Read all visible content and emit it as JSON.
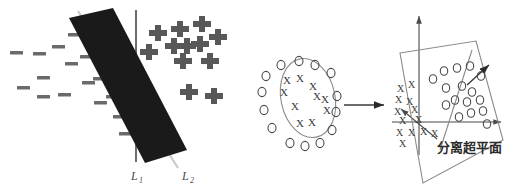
{
  "figure": {
    "background_color": "#ffffff",
    "width": 506,
    "height": 191
  },
  "panel_left": {
    "name": "linear-separation-panel",
    "bar": {
      "label": "decision-margin-bar",
      "color": "#1a1a1a",
      "angle_deg": 27,
      "corners": [
        [
          69,
          18
        ],
        [
          113,
          8
        ],
        [
          187,
          150
        ],
        [
          145,
          163
        ]
      ]
    },
    "line_L1": {
      "label": "L_1",
      "label_base": "L",
      "label_sub": "1",
      "color": "#6e6e6e",
      "x1": 136,
      "y1": 10,
      "x2": 136,
      "y2": 162,
      "label_x": 131,
      "label_y": 180
    },
    "line_L2": {
      "label": "L_2",
      "label_base": "L",
      "label_sub": "2",
      "color": "#c9c9c9",
      "x1": 78,
      "y1": 11,
      "x2": 178,
      "y2": 168,
      "label_x": 182,
      "label_y": 180
    },
    "minus_color": "#6a6a6a",
    "plus_color": "#585858",
    "minus_points": [
      [
        16,
        53
      ],
      [
        39,
        54
      ],
      [
        58,
        47
      ],
      [
        74,
        35
      ],
      [
        23,
        88
      ],
      [
        43,
        78
      ],
      [
        71,
        64
      ],
      [
        86,
        57
      ],
      [
        43,
        97
      ],
      [
        64,
        95
      ],
      [
        88,
        83
      ],
      [
        99,
        79
      ],
      [
        100,
        103
      ],
      [
        112,
        97
      ],
      [
        119,
        117
      ],
      [
        125,
        134
      ]
    ],
    "plus_points": [
      [
        152,
        33
      ],
      [
        174,
        29
      ],
      [
        196,
        24
      ],
      [
        212,
        37
      ],
      [
        168,
        46
      ],
      [
        181,
        46
      ],
      [
        194,
        44
      ],
      [
        143,
        52
      ],
      [
        177,
        61
      ],
      [
        204,
        61
      ],
      [
        183,
        92
      ],
      [
        208,
        96
      ]
    ]
  },
  "panel_middle": {
    "name": "nonlinear-circle-panel",
    "ellipse": {
      "cx": 308,
      "cy": 98,
      "rx": 27,
      "ry": 40,
      "rotate": -12,
      "stroke": "#8c8c8c"
    },
    "o_color": "#4a4a4a",
    "x_color": "#3c3c3c",
    "o_points": [
      [
        281,
        65
      ],
      [
        299,
        61
      ],
      [
        315,
        65
      ],
      [
        266,
        76
      ],
      [
        331,
        73
      ],
      [
        262,
        92
      ],
      [
        337,
        96
      ],
      [
        264,
        110
      ],
      [
        336,
        112
      ],
      [
        272,
        128
      ],
      [
        332,
        130
      ],
      [
        290,
        143
      ],
      [
        305,
        146
      ],
      [
        320,
        143
      ]
    ],
    "x_points": [
      [
        287,
        80
      ],
      [
        300,
        78
      ],
      [
        313,
        86
      ],
      [
        284,
        92
      ],
      [
        317,
        96
      ],
      [
        325,
        99
      ],
      [
        295,
        106
      ],
      [
        327,
        110
      ],
      [
        300,
        123
      ],
      [
        312,
        122
      ]
    ]
  },
  "arrow_transform": {
    "name": "mapping-arrow",
    "x1": 344,
    "y1": 105,
    "x2": 386,
    "y2": 105,
    "color": "#3a3a3a"
  },
  "panel_right": {
    "name": "hyperplane-3d-panel",
    "plane": {
      "label": "separating-plane",
      "corners": [
        [
          400,
          53
        ],
        [
          476,
          41
        ],
        [
          503,
          140
        ],
        [
          423,
          183
        ]
      ],
      "stroke": "#8a8a8a"
    },
    "divider_line": {
      "x1": 472,
      "y1": 50,
      "x2": 440,
      "y2": 148,
      "stroke": "#8a8a8a"
    },
    "axis_vertical": {
      "x1": 419,
      "y1": 14,
      "x2": 419,
      "y2": 155,
      "color": "#4a4a4a"
    },
    "axis_horizontal": {
      "x1": 392,
      "y1": 122,
      "x2": 503,
      "y2": 122,
      "color": "#4a4a4a"
    },
    "axis_diagonal": {
      "x1": 437,
      "y1": 138,
      "x2": 400,
      "y2": 108,
      "color": "#4a4a4a"
    },
    "normal_arrow": {
      "x1": 467,
      "y1": 85,
      "x2": 491,
      "y2": 63,
      "color": "#2b2b2b"
    },
    "caption": "分离超平面",
    "caption_x": 437,
    "caption_y": 152,
    "o_color": "#4a4a4a",
    "x_color": "#3c3c3c",
    "o_points": [
      [
        444,
        71
      ],
      [
        457,
        68
      ],
      [
        470,
        66
      ],
      [
        433,
        79
      ],
      [
        481,
        76
      ],
      [
        446,
        88
      ],
      [
        462,
        86
      ],
      [
        472,
        92
      ],
      [
        455,
        100
      ],
      [
        467,
        102
      ],
      [
        480,
        100
      ],
      [
        446,
        105
      ],
      [
        471,
        113
      ],
      [
        483,
        111
      ],
      [
        459,
        117
      ],
      [
        487,
        122
      ]
    ],
    "x_points": [
      [
        401,
        89
      ],
      [
        412,
        85
      ],
      [
        399,
        100
      ],
      [
        410,
        102
      ],
      [
        398,
        112
      ],
      [
        415,
        110
      ],
      [
        403,
        121
      ],
      [
        419,
        120
      ],
      [
        400,
        133
      ],
      [
        412,
        133
      ],
      [
        424,
        132
      ],
      [
        435,
        134
      ],
      [
        403,
        143
      ]
    ]
  }
}
